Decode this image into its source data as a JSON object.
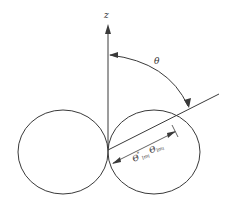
{
  "diagram": {
    "axis_label": "z",
    "angle_label": "θ",
    "radius_label_main": "Θ",
    "radius_label_sup": "*",
    "radius_label_sub1": "lm",
    "radius_label_sub1b": "l",
    "radius_label_main2": "Θ",
    "radius_label_sub2": "lm",
    "radius_label_sub2b": "l",
    "stroke_color": "#3a3a3a",
    "elements": [
      {
        "type": "axis",
        "name": "z-axis",
        "direction": "vertical-up"
      },
      {
        "type": "lobe",
        "name": "left-lobe",
        "shape": "ellipse"
      },
      {
        "type": "lobe",
        "name": "right-lobe",
        "shape": "ellipse"
      },
      {
        "type": "ray",
        "name": "direction-ray",
        "angle_from_z": "θ"
      },
      {
        "type": "arc",
        "name": "theta-arc"
      },
      {
        "type": "dimension",
        "name": "radius-dimension"
      }
    ]
  }
}
